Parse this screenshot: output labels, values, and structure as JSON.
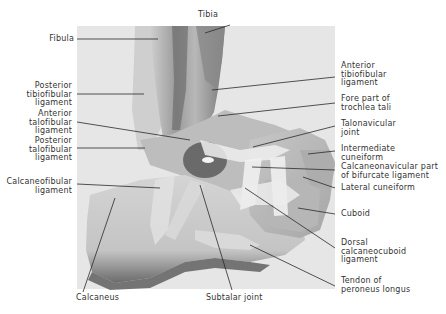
{
  "figure": {
    "labels": {
      "tibia": "Tibia",
      "fibula": "Fibula",
      "posterior_tibiofibular": [
        "Posterior",
        "tibiofibular",
        "ligament"
      ],
      "anterior_talofibular": [
        "Anterior",
        "talofibular",
        "ligament"
      ],
      "posterior_talofibular": [
        "Posterior",
        "talofibular",
        "ligament"
      ],
      "calcaneofibular": [
        "Calcaneofibular",
        "ligament"
      ],
      "calcaneus": "Calcaneus",
      "subtalar_joint": "Subtalar joint",
      "anterior_tibiofibular": [
        "Anterior",
        "tibiofibular",
        "ligament"
      ],
      "fore_part_trochlea": [
        "Fore part of",
        "trochlea tali"
      ],
      "talonavicular_joint": [
        "Talonavicular",
        "joint"
      ],
      "intermediate_cuneiform": [
        "Intermediate",
        "cuneiform"
      ],
      "calcaneonavicular_part": [
        "Calcaneonavicular part",
        "of bifurcate ligament"
      ],
      "lateral_cuneiform": "Lateral cuneiform",
      "cuboid": "Cuboid",
      "dorsal_calcaneocuboid": [
        "Dorsal",
        "calcaneocuboid",
        "ligament"
      ],
      "tendon_peroneus_longus": [
        "Tendon of",
        "peroneus longus"
      ]
    },
    "colors": {
      "background": "#ffffff",
      "illustration_bg": "#e4e4e4",
      "bone_light": "#d2d2d2",
      "bone_mid": "#a8a8a8",
      "bone_dark": "#5a5a5a",
      "ligament": "#efefef",
      "leader_line": "#2a2a2a",
      "text": "#333333"
    }
  }
}
